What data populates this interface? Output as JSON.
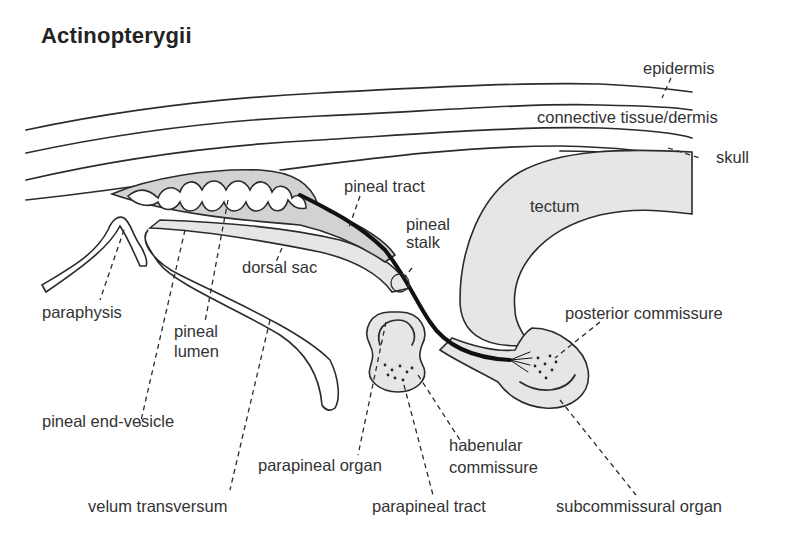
{
  "title": "Actinopterygii",
  "labels": {
    "epidermis": "epidermis",
    "connective_tissue": "connective tissue/dermis",
    "skull": "skull",
    "pineal_tract": "pineal tract",
    "tectum": "tectum",
    "pineal_stalk_1": "pineal",
    "pineal_stalk_2": "stalk",
    "dorsal_sac": "dorsal sac",
    "paraphysis": "paraphysis",
    "pineal_lumen_1": "pineal",
    "pineal_lumen_2": "lumen",
    "posterior_commissure": "posterior commissure",
    "pineal_end_vesicle": "pineal end-vesicle",
    "habenular_commissure_1": "habenular",
    "habenular_commissure_2": "commissure",
    "parapineal_organ": "parapineal organ",
    "velum_transversum": "velum transversum",
    "parapineal_tract": "parapineal tract",
    "subcommissural_organ": "subcommissural organ"
  },
  "colors": {
    "tissue_fill": "#d2d2d2",
    "light_fill": "#e6e6e6",
    "outline": "#2b2b2b",
    "background": "#ffffff"
  }
}
